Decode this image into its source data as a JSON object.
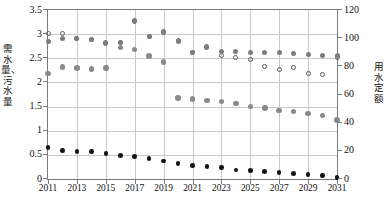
{
  "axes": {
    "y_left_title": "需水量、污水量",
    "y_right_title": "用水定额",
    "y_left_ticks": [
      "0",
      "0.5",
      "1",
      "1.5",
      "2",
      "2.5",
      "3",
      "3.5"
    ],
    "y_right_ticks": [
      "0",
      "20",
      "40",
      "60",
      "80",
      "100",
      "120"
    ],
    "x_ticks": [
      "2011",
      "2013",
      "2015",
      "2017",
      "2019",
      "2021",
      "2023",
      "2025",
      "2027",
      "2029",
      "2031"
    ]
  },
  "chart_data": {
    "type": "scatter",
    "title": "",
    "xlabel": "",
    "ylabel": "需水量、污水量",
    "y2label": "用水定额",
    "xlim": [
      2011,
      2031
    ],
    "ylim": [
      0,
      3.5
    ],
    "y2lim": [
      0,
      120
    ],
    "grid": true,
    "legend": "none",
    "x": [
      2011,
      2012,
      2013,
      2014,
      2015,
      2016,
      2017,
      2018,
      2019,
      2020,
      2021,
      2022,
      2023,
      2024,
      2025,
      2026,
      2027,
      2028,
      2029,
      2030,
      2031
    ],
    "series": [
      {
        "name": "用水定额",
        "marker": "open-circle",
        "color": "#5a5a5a",
        "axis": "right",
        "values": [
          103,
          103,
          100,
          99,
          96,
          97,
          112,
          101,
          104,
          98,
          90,
          94,
          88,
          86,
          85,
          80,
          78,
          79,
          75,
          74,
          86
        ]
      },
      {
        "name": "需水量-上",
        "marker": "filled-circle",
        "color": "#7d7d7d",
        "axis": "left",
        "values": [
          2.85,
          2.92,
          2.9,
          2.88,
          2.82,
          2.83,
          3.28,
          2.95,
          3.05,
          2.85,
          2.62,
          2.73,
          2.65,
          2.65,
          2.63,
          2.62,
          2.62,
          2.6,
          2.58,
          2.55,
          2.55
        ]
      },
      {
        "name": "需水量-中",
        "marker": "filled-circle",
        "color": "#8a8a8a",
        "axis": "left",
        "values": [
          2.18,
          2.32,
          2.3,
          2.28,
          2.3,
          2.72,
          2.68,
          2.55,
          2.42,
          1.68,
          1.66,
          1.63,
          1.6,
          1.56,
          1.5,
          1.47,
          1.42,
          1.4,
          1.36,
          1.32,
          1.22
        ]
      },
      {
        "name": "污水量",
        "marker": "filled-circle",
        "color": "#141414",
        "axis": "left",
        "values": [
          0.65,
          0.59,
          0.57,
          0.57,
          0.53,
          0.49,
          0.47,
          0.42,
          0.37,
          0.32,
          0.28,
          0.26,
          0.24,
          0.19,
          0.18,
          0.15,
          0.13,
          0.11,
          0.09,
          0.07,
          0.03
        ]
      }
    ]
  }
}
